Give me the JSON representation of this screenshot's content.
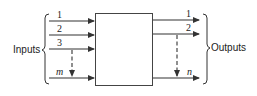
{
  "diagram": {
    "type": "block-diagram",
    "colors": {
      "stroke": "#333333",
      "text": "#222222",
      "background": "#ffffff"
    },
    "inputs": {
      "group_label": "Inputs",
      "lines": [
        {
          "label": "1"
        },
        {
          "label": "2"
        },
        {
          "label": "3"
        },
        {
          "label": "m"
        }
      ]
    },
    "block": {
      "label": ""
    },
    "outputs": {
      "group_label": "Outputs",
      "lines": [
        {
          "label": "1"
        },
        {
          "label": "2"
        },
        {
          "label": "n"
        }
      ]
    }
  }
}
